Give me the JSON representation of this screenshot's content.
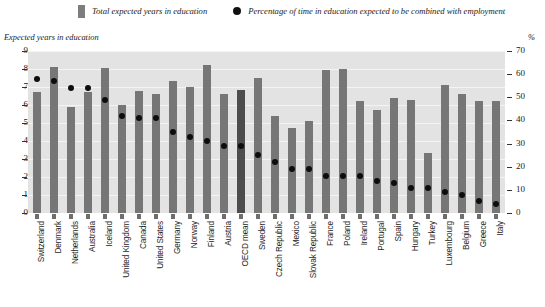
{
  "legend": {
    "bar_series_label": "Total expected years in education",
    "dot_series_label": "Percentage of time in education expected to be combined with employment",
    "bar_color": "#7d7d7d",
    "dot_color": "#111111"
  },
  "axes": {
    "left_caption": "Expected years in education",
    "right_caption": "%",
    "left_ticks": [
      "9",
      "8",
      "7",
      "6",
      "5",
      "4",
      "3",
      "2",
      "1",
      "0"
    ],
    "right_ticks": [
      "70",
      "60",
      "50",
      "40",
      "30",
      "20",
      "10",
      "0"
    ]
  },
  "chart_data": {
    "type": "bar",
    "title": "",
    "subtitle": "",
    "xlabel": "",
    "ylabel": "Expected years in education",
    "y2label": "%",
    "ylim": [
      0,
      9
    ],
    "y2lim": [
      0,
      70
    ],
    "grid": true,
    "legend_position": "top",
    "highlight_category": "OECD mean",
    "categories": [
      "Switzerland",
      "Denmark",
      "Netherlands",
      "Australia",
      "Iceland",
      "United Kingdom",
      "Canada",
      "United States",
      "Germany",
      "Norway",
      "Finland",
      "Austria",
      "OECD mean",
      "Sweden",
      "Czech Republic",
      "Mexico",
      "Slovak Republic",
      "France",
      "Poland",
      "Ireland",
      "Portugal",
      "Spain",
      "Hungary",
      "Turkey",
      "Luxembourg",
      "Belgium",
      "Greece",
      "Italy"
    ],
    "series": [
      {
        "name": "Total expected years in education",
        "type": "bar",
        "axis": "left",
        "unit": "years",
        "values": [
          6.75,
          8.1,
          5.9,
          6.7,
          8.05,
          6.0,
          6.8,
          6.6,
          7.35,
          7.0,
          8.2,
          6.6,
          6.85,
          7.5,
          5.4,
          4.75,
          5.1,
          7.95,
          8.0,
          6.25,
          5.7,
          6.4,
          6.3,
          3.35,
          7.1,
          6.6,
          6.2,
          6.2
        ]
      },
      {
        "name": "Percentage of time in education expected to be combined with employment",
        "type": "scatter",
        "axis": "right",
        "unit": "%",
        "values": [
          58,
          57,
          54,
          54,
          49,
          42,
          41,
          41,
          35,
          33,
          31,
          29,
          29,
          25,
          22,
          19,
          19,
          16,
          16,
          16,
          14,
          13,
          11,
          11,
          9,
          8,
          5,
          4
        ]
      }
    ]
  }
}
